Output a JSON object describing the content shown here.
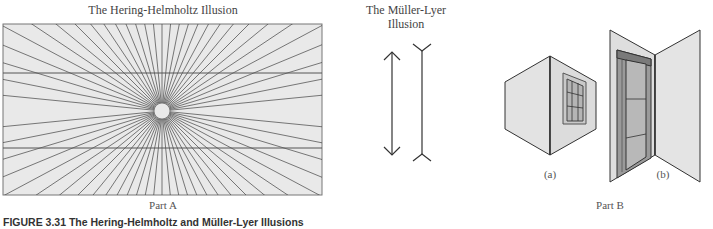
{
  "figure": {
    "caption": "FIGURE 3.31   The Hering-Helmholtz and Müller-Lyer Illusions",
    "part_a": {
      "title": "The Hering-Helmholtz Illusion",
      "label": "Part A"
    },
    "muller_lyer": {
      "title_line1": "The Müller-Lyer",
      "title_line2": "Illusion"
    },
    "part_b": {
      "label": "Part B",
      "sub_a": "(a)",
      "sub_b": "(b)"
    }
  },
  "colors": {
    "panel_fill": "#e8e8e8",
    "line": "#333333",
    "wall_fill": "#dedede"
  }
}
